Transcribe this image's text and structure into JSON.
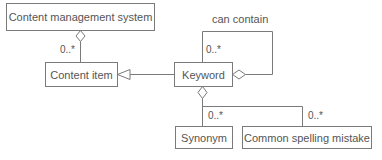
{
  "diagram": {
    "type": "UML class diagram",
    "classes": {
      "cms": "Content management system",
      "content_item": "Content item",
      "keyword": "Keyword",
      "synonym": "Synonym",
      "spelling_mistake": "Common spelling mistake"
    },
    "labels": {
      "cms_multiplicity": "0..*",
      "self_assoc_name": "can contain",
      "self_assoc_multiplicity": "0..*",
      "synonym_multiplicity": "0..*",
      "spelling_multiplicity": "0..*"
    },
    "relationships": [
      {
        "from": "Content management system",
        "to": "Content item",
        "kind": "aggregation",
        "multiplicity": "0..*"
      },
      {
        "from": "Keyword",
        "to": "Content item",
        "kind": "generalization"
      },
      {
        "from": "Keyword",
        "to": "Keyword",
        "kind": "aggregation",
        "name": "can contain",
        "multiplicity": "0..*"
      },
      {
        "from": "Keyword",
        "to": "Synonym",
        "kind": "aggregation",
        "multiplicity": "0..*"
      },
      {
        "from": "Keyword",
        "to": "Common spelling mistake",
        "kind": "aggregation",
        "multiplicity": "0..*"
      }
    ],
    "colors": {
      "line": "#7a7a7a",
      "text": "#555555",
      "background": "#ffffff"
    }
  }
}
